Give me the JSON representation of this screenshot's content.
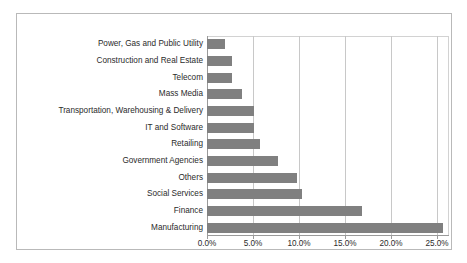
{
  "chart_data": {
    "type": "bar",
    "orientation": "horizontal",
    "title": "",
    "subtitle": "",
    "xlabel": "",
    "ylabel": "",
    "xlim": [
      0,
      26.3
    ],
    "ylim": null,
    "grid": "vertical",
    "legend": "none",
    "bar_color": "#808080",
    "plot_background": "#ffffff",
    "frame_color": "#b9b9b9",
    "gridline_color": "#c8c8c8",
    "tick_label_format": "percent-one-decimal",
    "xticks": [
      0,
      5,
      10,
      15,
      20,
      25
    ],
    "xtick_labels": [
      "0.0%",
      "5.0%",
      "10.0%",
      "15.0%",
      "20.0%",
      "25.0%"
    ],
    "categories": [
      "Power, Gas and Public Utility",
      "Construction and Real Estate",
      "Telecom",
      "Mass Media",
      "Transportation, Warehousing & Delivery",
      "IT and Software",
      "Retailing",
      "Government Agencies",
      "Others",
      "Social Services",
      "Finance",
      "Manufacturing"
    ],
    "values": [
      2.0,
      2.7,
      2.7,
      3.8,
      5.1,
      5.1,
      5.8,
      7.7,
      9.8,
      10.3,
      16.8,
      25.7
    ],
    "value_labels": [
      "2.0%",
      "2.7%",
      "2.7%",
      "3.8%",
      "5.1%",
      "5.1%",
      "5.8%",
      "7.7%",
      "9.8%",
      "10.3%",
      "16.8%",
      "25.7%"
    ]
  }
}
